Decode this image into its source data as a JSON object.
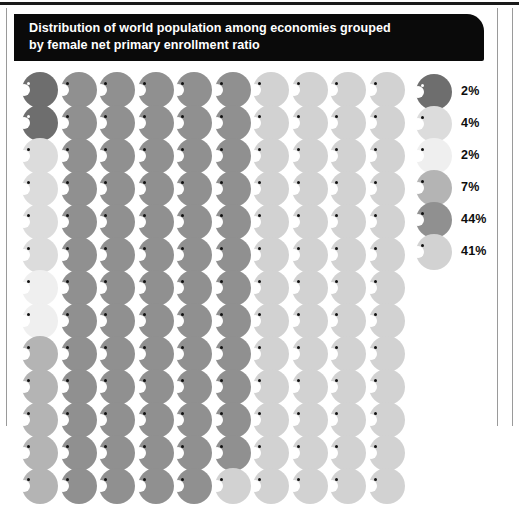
{
  "page": {
    "background_color": "#ffffff",
    "frame_rule_color": "#9a9a9a"
  },
  "header": {
    "background_color": "#0a0a0a",
    "text_color": "#ffffff",
    "title_line_1": "Distribution of world population among economies grouped",
    "title_line_2": "by female net primary enrollment ratio",
    "title_full": "Distribution of world population among economies grouped by female net primary enrollment ratio"
  },
  "legend": {
    "items": [
      {
        "label": "2%",
        "value": 2,
        "color": "#6e6e6e",
        "swatch_name": "person-icon-dark-gray"
      },
      {
        "label": "4%",
        "value": 4,
        "color": "#dcdcdc",
        "swatch_name": "person-icon-light-gray"
      },
      {
        "label": "2%",
        "value": 2,
        "color": "#efefef",
        "swatch_name": "person-icon-very-light-gray"
      },
      {
        "label": "7%",
        "value": 7,
        "color": "#b4b4b4",
        "swatch_name": "person-icon-mid-light-gray"
      },
      {
        "label": "44%",
        "value": 44,
        "color": "#909090",
        "swatch_name": "person-icon-medium-gray"
      },
      {
        "label": "41%",
        "value": 41,
        "color": "#d2d2d2",
        "swatch_name": "person-icon-pale-gray"
      }
    ]
  },
  "chart_data": {
    "type": "pictogram",
    "title": "Distribution of world population among economies grouped by female net primary enrollment ratio",
    "unit_note": "each icon represents 1% of world population",
    "columns": 10,
    "rows": 10,
    "total_icons": 100,
    "categories": [
      "2%",
      "4%",
      "2%",
      "7%",
      "44%",
      "41%"
    ],
    "values": [
      2,
      4,
      2,
      7,
      44,
      41
    ],
    "colors": [
      "#6e6e6e",
      "#dcdcdc",
      "#efefef",
      "#b4b4b4",
      "#909090",
      "#d2d2d2"
    ],
    "legend_position": "right",
    "grid": false,
    "cells": [
      [
        0,
        4,
        4,
        4,
        4,
        4,
        5,
        5,
        5,
        5
      ],
      [
        0,
        4,
        4,
        4,
        4,
        4,
        5,
        5,
        5,
        5
      ],
      [
        1,
        4,
        4,
        4,
        4,
        4,
        5,
        5,
        5,
        5
      ],
      [
        1,
        4,
        4,
        4,
        4,
        4,
        5,
        5,
        5,
        5
      ],
      [
        1,
        4,
        4,
        4,
        4,
        4,
        5,
        5,
        5,
        5
      ],
      [
        1,
        4,
        4,
        4,
        4,
        4,
        5,
        5,
        5,
        5
      ],
      [
        2,
        4,
        4,
        4,
        4,
        4,
        5,
        5,
        5,
        5
      ],
      [
        2,
        4,
        4,
        4,
        4,
        4,
        5,
        5,
        5,
        5
      ],
      [
        3,
        4,
        4,
        4,
        4,
        4,
        5,
        5,
        5,
        5
      ],
      [
        3,
        4,
        4,
        4,
        4,
        4,
        5,
        5,
        5,
        5
      ],
      [
        3,
        4,
        4,
        4,
        4,
        4,
        5,
        5,
        5,
        5
      ],
      [
        3,
        4,
        4,
        4,
        4,
        4,
        5,
        5,
        5,
        5
      ],
      [
        3,
        4,
        4,
        4,
        4,
        5,
        5,
        5,
        5,
        5
      ]
    ]
  }
}
